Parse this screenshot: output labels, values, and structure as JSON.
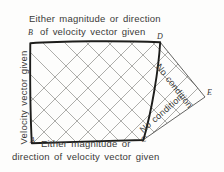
{
  "figure": {
    "top_caption_line1": "Either magnitude or direction",
    "top_caption_line2": "of velocity vector given",
    "left_caption": "Velocity vector given",
    "bottom_caption_line1": "Either magnitude or",
    "bottom_caption_line2": "direction of velocity vector given",
    "diagonal_label_upper": "No condition",
    "diagonal_label_lower": "No condition",
    "vertices": {
      "a": "A",
      "b": "B",
      "c": "C",
      "d": "D",
      "e": "E"
    },
    "colors": {
      "background": "#fdfdfc",
      "outline": "#1d1d1b",
      "grid": "#8a8a86",
      "text": "#3a3a38"
    }
  }
}
